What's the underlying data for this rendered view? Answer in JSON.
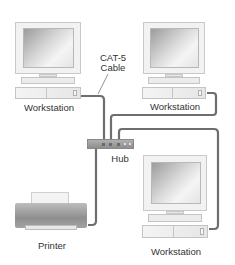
{
  "diagram": {
    "type": "network-topology",
    "nodes": [
      {
        "id": "ws1",
        "label": "Workstation",
        "kind": "workstation",
        "position": "top-left"
      },
      {
        "id": "ws2",
        "label": "Workstation",
        "kind": "workstation",
        "position": "top-right"
      },
      {
        "id": "hub",
        "label": "Hub",
        "kind": "hub",
        "position": "center"
      },
      {
        "id": "printer",
        "label": "Printer",
        "kind": "printer",
        "position": "bottom-left"
      },
      {
        "id": "ws3",
        "label": "Workstation",
        "kind": "workstation",
        "position": "bottom-right"
      }
    ],
    "edges": [
      {
        "from": "ws1",
        "to": "hub"
      },
      {
        "from": "ws2",
        "to": "hub"
      },
      {
        "from": "ws3",
        "to": "hub"
      },
      {
        "from": "printer",
        "to": "hub"
      }
    ],
    "annotations": [
      {
        "text_line1": "CAT-5",
        "text_line2": "Cable",
        "points_to": "ws1-hub cable"
      }
    ]
  },
  "labels": {
    "ws_top_left": "Workstation",
    "ws_top_right": "Workstation",
    "ws_bottom_right": "Workstation",
    "hub": "Hub",
    "printer": "Printer",
    "cable_line1": "CAT-5",
    "cable_line2": "Cable"
  },
  "colors": {
    "cable": "#6e6e6e",
    "hub": "#9a9a9a",
    "printer": "#a8a8a8",
    "text": "#333333"
  }
}
